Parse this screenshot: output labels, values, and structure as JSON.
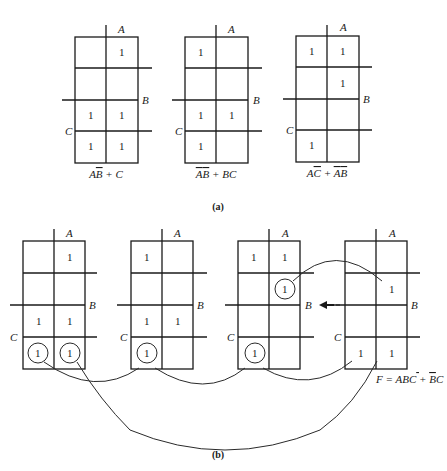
{
  "diagram": {
    "type": "karnaugh-map-figure",
    "variable_labels": {
      "a": "A",
      "b": "B",
      "c": "C"
    },
    "cell_value": "1",
    "part_a": {
      "caption": "(a)",
      "maps": [
        {
          "expression_main": "AB̄ + C",
          "ones": [
            [
              0,
              1
            ],
            [
              2,
              0
            ],
            [
              2,
              1
            ],
            [
              3,
              0
            ],
            [
              3,
              1
            ]
          ]
        },
        {
          "expression_main": "ĀB̄ + BC",
          "ones": [
            [
              0,
              0
            ],
            [
              2,
              0
            ],
            [
              2,
              1
            ],
            [
              3,
              0
            ]
          ]
        },
        {
          "expression_main": "AC̄ + ĀB̄",
          "ones": [
            [
              0,
              0
            ],
            [
              0,
              1
            ],
            [
              1,
              1
            ],
            [
              3,
              0
            ]
          ]
        }
      ]
    },
    "part_b": {
      "caption": "(b)",
      "maps": [
        {
          "ones": [
            [
              0,
              1
            ],
            [
              2,
              0
            ],
            [
              2,
              1
            ],
            [
              3,
              0
            ],
            [
              3,
              1
            ]
          ],
          "circled": [
            [
              3,
              0
            ],
            [
              3,
              1
            ]
          ]
        },
        {
          "ones": [
            [
              0,
              0
            ],
            [
              2,
              0
            ],
            [
              2,
              1
            ],
            [
              3,
              0
            ]
          ],
          "circled": [
            [
              3,
              0
            ]
          ]
        },
        {
          "ones": [
            [
              0,
              0
            ],
            [
              0,
              1
            ],
            [
              1,
              1
            ],
            [
              3,
              0
            ]
          ],
          "circled": [
            [
              1,
              1
            ],
            [
              3,
              0
            ]
          ]
        },
        {
          "ones": [
            [
              1,
              1
            ],
            [
              3,
              0
            ],
            [
              3,
              1
            ]
          ],
          "circled": []
        }
      ],
      "result_expression": "F = ABC̄ + B̄C",
      "arrow": "left-arrow"
    },
    "colors": {
      "ink": "#1a1a1a",
      "background": "#ffffff"
    }
  }
}
